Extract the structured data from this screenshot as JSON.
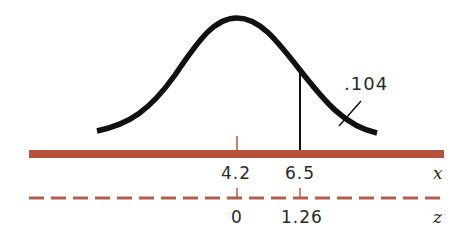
{
  "diagram": {
    "type": "normal-distribution-tail-area",
    "curve": "bell-shaped normal curve",
    "shaded_region_label": ".104",
    "cutoff_line": "vertical line at x = 6.5",
    "x_axis": {
      "name": "x",
      "ticks": [
        {
          "label": "4.2",
          "meaning": "mean"
        },
        {
          "label": "6.5",
          "meaning": "cutoff"
        }
      ],
      "color": "#b5533c",
      "style": "solid"
    },
    "z_axis": {
      "name": "z",
      "ticks": [
        {
          "label": "0"
        },
        {
          "label": "1.26"
        }
      ],
      "color": "#b0604a",
      "style": "dashed"
    }
  }
}
